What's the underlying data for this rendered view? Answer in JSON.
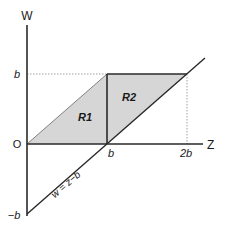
{
  "diagram": {
    "axes": {
      "horizontal_label": "Z",
      "vertical_label": "W",
      "origin_label": "O"
    },
    "ticks": {
      "w_b": "b",
      "w_neg_b": "−b",
      "z_b": "b",
      "z_2b": "2b"
    },
    "regions": [
      {
        "label": "R1",
        "fill": "#d6d6d6"
      },
      {
        "label": "R2",
        "fill": "#d6d6d6"
      }
    ],
    "line_label": "w = z−b",
    "colors": {
      "axis": "#2a2a2a",
      "region_fill": "#d6d6d6",
      "dotted": "#888888"
    }
  }
}
